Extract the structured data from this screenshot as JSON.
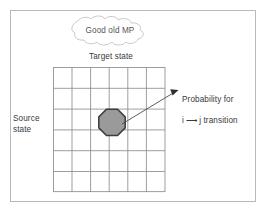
{
  "figure": {
    "title_callout": "Good old MP",
    "axis_labels": {
      "top": "Target state",
      "left": "Source state"
    },
    "annotation": {
      "line1": "Probability for",
      "line2_prefix": "i ",
      "line2_arrow": "⟶",
      "line2_suffix": " j transition"
    },
    "grid": {
      "rows": 6,
      "cols": 6,
      "marker_row": 3,
      "marker_col": 3
    },
    "colors": {
      "frame": "#b9b9b9",
      "grid_line": "#8c8c8c",
      "marker_fill": "#9a9a9a",
      "marker_stroke": "#3c3c3c",
      "arrow": "#4a4a4a",
      "text": "#3a3a3a",
      "cloud_stroke": "#c0c0c0",
      "background": "#ffffff"
    }
  }
}
